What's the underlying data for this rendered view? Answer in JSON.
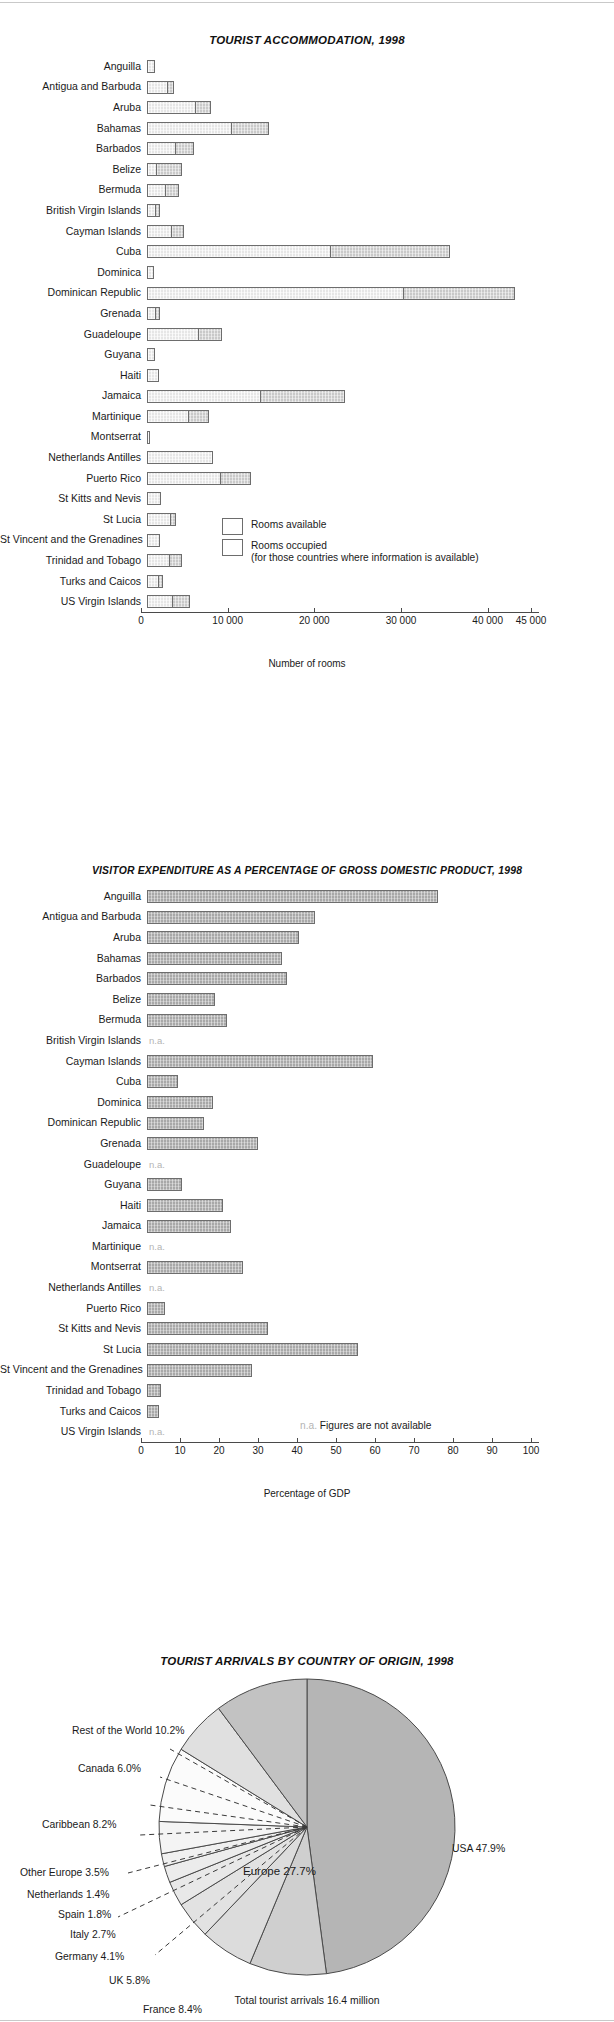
{
  "page": {
    "background": "#ffffff"
  },
  "chart_data": [
    {
      "type": "bar",
      "orientation": "horizontal",
      "stacked_overlay": true,
      "title": "TOURIST ACCOMMODATION, 1998",
      "xlabel": "Number of rooms",
      "ylabel": "",
      "xlim": [
        0,
        45000
      ],
      "xticks": [
        0,
        10000,
        20000,
        30000,
        40000,
        45000
      ],
      "xticklabels": [
        "0",
        "10 000",
        "20 000",
        "30 000",
        "40 000",
        "45 000"
      ],
      "grid": false,
      "legend": {
        "position": "inside-bottom-right",
        "entries": [
          {
            "label": "Rooms available",
            "sublabel": "",
            "color": "#c9c9c9"
          },
          {
            "label": "Rooms occupied",
            "sublabel": "(for those countries where information is available)",
            "color": "#e6e6e6"
          }
        ]
      },
      "categories": [
        "Anguilla",
        "Antigua and Barbuda",
        "Aruba",
        "Bahamas",
        "Barbados",
        "Belize",
        "Bermuda",
        "British Virgin Islands",
        "Cayman Islands",
        "Cuba",
        "Dominica",
        "Dominican Republic",
        "Grenada",
        "Guadeloupe",
        "Guyana",
        "Haiti",
        "Jamaica",
        "Martinique",
        "Montserrat",
        "Netherlands Antilles",
        "Puerto Rico",
        "St Kitts and Nevis",
        "St Lucia",
        "St Vincent and the Grenadines",
        "Trinidad and Tobago",
        "Turks and Caicos",
        "US Virgin Islands"
      ],
      "series": [
        {
          "name": "Rooms available",
          "values": [
            900,
            3100,
            7400,
            14100,
            5400,
            4000,
            3700,
            1500,
            4300,
            35000,
            800,
            42500,
            1500,
            8600,
            900,
            1400,
            22800,
            7100,
            200,
            7600,
            12000,
            1600,
            3400,
            1500,
            4000,
            1900,
            5000
          ]
        },
        {
          "name": "Rooms occupied",
          "values": [
            900,
            2400,
            5700,
            9800,
            3300,
            1200,
            2200,
            1000,
            2900,
            21200,
            800,
            29700,
            1000,
            6000,
            900,
            1400,
            13200,
            4800,
            200,
            7600,
            8500,
            1600,
            2800,
            1500,
            2600,
            1400,
            3000
          ]
        }
      ]
    },
    {
      "type": "bar",
      "orientation": "horizontal",
      "title": "VISITOR EXPENDITURE AS A PERCENTAGE OF GROSS DOMESTIC PRODUCT, 1998",
      "xlabel": "Percentage of GDP",
      "ylabel": "",
      "xlim": [
        0,
        100
      ],
      "xticks": [
        0,
        10,
        20,
        30,
        40,
        50,
        60,
        70,
        80,
        90,
        100
      ],
      "xticklabels": [
        "0",
        "10",
        "20",
        "30",
        "40",
        "50",
        "60",
        "70",
        "80",
        "90",
        "100"
      ],
      "grid": false,
      "na_note": "Figures are not available",
      "na_tag": "n.a.",
      "bar_color": "#a8a8a8",
      "categories": [
        "Anguilla",
        "Antigua and Barbuda",
        "Aruba",
        "Bahamas",
        "Barbados",
        "Belize",
        "Bermuda",
        "British Virgin Islands",
        "Cayman Islands",
        "Cuba",
        "Dominica",
        "Dominican Republic",
        "Grenada",
        "Guadeloupe",
        "Guyana",
        "Haiti",
        "Jamaica",
        "Martinique",
        "Montserrat",
        "Netherlands Antilles",
        "Puerto Rico",
        "St Kitts and Nevis",
        "St Lucia",
        "St Vincent and the Grenadines",
        "Trinidad and Tobago",
        "Turks and Caicos",
        "US Virgin Islands"
      ],
      "values": [
        74.5,
        43.0,
        39.0,
        34.5,
        36.0,
        17.5,
        20.5,
        null,
        58.0,
        8.0,
        17.0,
        14.5,
        28.5,
        null,
        9.0,
        19.5,
        21.5,
        null,
        24.5,
        null,
        4.5,
        31.0,
        54.0,
        27.0,
        3.5,
        3.0,
        null
      ]
    },
    {
      "type": "pie",
      "title": "TOURIST ARRIVALS BY COUNTRY OF ORIGIN, 1998",
      "total_label": "Total tourist arrivals 16.4 million",
      "group_label": "Europe 27.7%",
      "labels": [
        "USA",
        "France",
        "UK",
        "Germany",
        "Italy",
        "Spain",
        "Netherlands",
        "Other Europe",
        "Caribbean",
        "Canada",
        "Rest of the World"
      ],
      "values": [
        47.9,
        8.4,
        5.8,
        4.1,
        2.7,
        1.8,
        1.4,
        3.5,
        8.2,
        6.0,
        10.2
      ],
      "label_texts": [
        "USA 47.9%",
        "France 8.4%",
        "UK 5.8%",
        "Germany 4.1%",
        "Italy 2.7%",
        "Spain 1.8%",
        "Netherlands 1.4%",
        "Other Europe 3.5%",
        "Caribbean  8.2%",
        "Canada 6.0%",
        "Rest of the World 10.2%"
      ],
      "colors": [
        "#b5b5b5",
        "#cfcfcf",
        "#dcdcdc",
        "#e2e2e2",
        "#e8e8e8",
        "#ececec",
        "#f0f0f0",
        "#f4f4f4",
        "#fbfbfb",
        "#e0e0e0",
        "#c2c2c2"
      ]
    }
  ]
}
